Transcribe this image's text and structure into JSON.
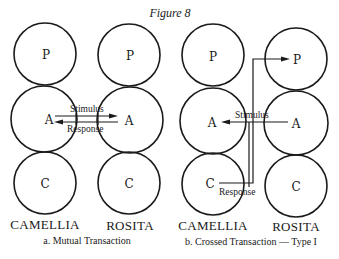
{
  "figure": {
    "title": "Figure 8"
  },
  "diagram_a": {
    "caption": "a. Mutual Transaction",
    "left_person": {
      "name": "CAMELLIA",
      "states": [
        "P",
        "A",
        "C"
      ]
    },
    "right_person": {
      "name": "ROSITA",
      "states": [
        "P",
        "A",
        "C"
      ]
    },
    "arrows": {
      "stimulus_label": "Stimulus",
      "response_label": "Response"
    }
  },
  "diagram_b": {
    "caption": "b. Crossed Transaction — Type I",
    "left_person": {
      "name": "CAMELLIA",
      "states": [
        "P",
        "A",
        "C"
      ]
    },
    "right_person": {
      "name": "ROSITA",
      "states": [
        "P",
        "A",
        "C"
      ]
    },
    "arrows": {
      "stimulus_label": "Stimulus",
      "response_label": "Response"
    }
  }
}
